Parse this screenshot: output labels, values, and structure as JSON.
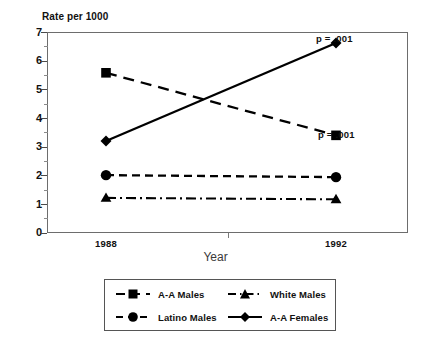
{
  "chart_data": {
    "type": "line",
    "title": "",
    "ylabel": "Rate per 1000",
    "xlabel": "Year",
    "categories": [
      "1988",
      "1992"
    ],
    "x": [
      1988,
      1992
    ],
    "ylim": [
      0,
      7
    ],
    "yticks": [
      0,
      1,
      2,
      3,
      4,
      5,
      6,
      7
    ],
    "ytick_labels": [
      "0",
      "1",
      "2",
      "3",
      "4",
      "5",
      "6",
      "7"
    ],
    "grid": false,
    "legend_position": "below-axes",
    "series": [
      {
        "name": "A-A Males",
        "values": [
          5.6,
          3.4
        ],
        "marker": "square",
        "linestyle": "dashed",
        "color": "#000000"
      },
      {
        "name": "White Males",
        "values": [
          1.2,
          1.15
        ],
        "marker": "triangle",
        "linestyle": "dash-dot",
        "color": "#000000"
      },
      {
        "name": "Latino Males",
        "values": [
          2.0,
          1.93
        ],
        "marker": "circle",
        "linestyle": "dashed-short",
        "color": "#000000"
      },
      {
        "name": "A-A Females",
        "values": [
          3.2,
          6.65
        ],
        "marker": "diamond",
        "linestyle": "solid",
        "color": "#000000"
      }
    ],
    "annotations": [
      {
        "text": "p = .001",
        "series": "A-A Females",
        "at_x": "1992",
        "at_y": 6.65
      },
      {
        "text": "p = .001",
        "series": "A-A Males",
        "at_x": "1992",
        "at_y": 3.4
      }
    ]
  },
  "legend": {
    "entries": [
      {
        "label": "A-A Males"
      },
      {
        "label": "White Males"
      },
      {
        "label": "Latino Males"
      },
      {
        "label": "A-A Females"
      }
    ]
  }
}
